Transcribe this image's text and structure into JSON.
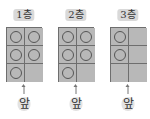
{
  "floors": [
    {
      "label": "1층",
      "cells": [
        true,
        true,
        true,
        true,
        true,
        false
      ],
      "front_label": "앞"
    },
    {
      "label": "2층",
      "cells": [
        true,
        true,
        true,
        true,
        true,
        false
      ],
      "front_label": "앞"
    },
    {
      "label": "3층",
      "cells": [
        true,
        false,
        true,
        false,
        false,
        false
      ],
      "front_label": "앞"
    }
  ],
  "colors": {
    "cell_fill": "#b8b8b8",
    "grid_line": "#6e6e6e"
  }
}
